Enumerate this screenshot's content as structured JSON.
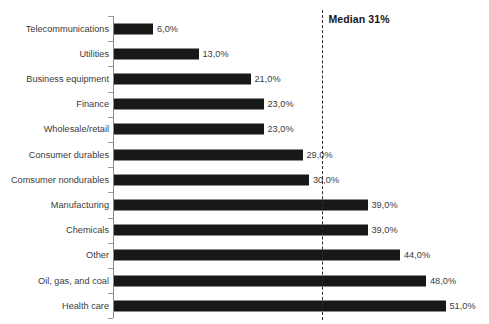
{
  "title_remnant": "",
  "annotation": {
    "median_label": "Median 31%",
    "median_value": 31
  },
  "axis": {
    "baseline_color": "#8a8a8a",
    "bar_color": "#181818",
    "text_color": "#3b3b3b",
    "median_line_color": "#2b2b2b"
  },
  "chart_data": {
    "type": "bar",
    "orientation": "horizontal",
    "title": "",
    "subtitle": "",
    "xlabel": "",
    "ylabel": "",
    "xlim": [
      0,
      55
    ],
    "grid": false,
    "legend": false,
    "value_suffix": "%",
    "decimal_separator": ",",
    "categories": [
      "Telecommunications",
      "Utilities",
      "Business equipment",
      "Finance",
      "Wholesale/retail",
      "Consumer durables",
      "Comsumer nondurables",
      "Manufacturing",
      "Chemicals",
      "Other",
      "Oil, gas, and coal",
      "Health care"
    ],
    "values": [
      6,
      13,
      21,
      23,
      23,
      29,
      30,
      39,
      39,
      44,
      48,
      51
    ],
    "labels": [
      "6,0%",
      "13,0%",
      "21,0%",
      "23,0%",
      "23,0%",
      "29,0%",
      "30,0%",
      "39,0%",
      "39,0%",
      "44,0%",
      "48,0%",
      "51,0%"
    ],
    "annotations": [
      {
        "type": "vline",
        "value": 31,
        "label": "Median 31%",
        "style": "dashed"
      }
    ]
  }
}
